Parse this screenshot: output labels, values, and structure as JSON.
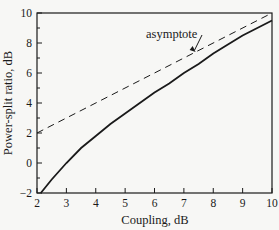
{
  "chart_data": {
    "type": "line",
    "title": "",
    "xlabel": "Coupling, dB",
    "ylabel": "Power-split ratio, dB",
    "xlim": [
      2,
      10
    ],
    "ylim": [
      -2,
      10
    ],
    "x_ticks": [
      2,
      3,
      4,
      5,
      6,
      7,
      8,
      9,
      10
    ],
    "y_ticks": [
      -2,
      0,
      2,
      4,
      6,
      8,
      10
    ],
    "y_minor_ticks": [
      -1,
      1,
      3,
      5,
      7,
      9
    ],
    "grid": false,
    "legend": null,
    "series": [
      {
        "name": "power-split ratio",
        "style": "solid",
        "x": [
          2.13,
          2.5,
          3.0,
          3.5,
          4.0,
          4.5,
          5.0,
          5.5,
          6.0,
          6.5,
          7.0,
          7.5,
          8.0,
          8.5,
          9.0,
          9.5,
          10.0
        ],
        "values": [
          -2.0,
          -1.1,
          0.0,
          1.0,
          1.8,
          2.6,
          3.3,
          4.0,
          4.7,
          5.3,
          6.0,
          6.6,
          7.3,
          7.9,
          8.5,
          9.0,
          9.5
        ]
      },
      {
        "name": "asymptote",
        "style": "dashed",
        "x": [
          2,
          10
        ],
        "values": [
          2,
          10
        ]
      }
    ],
    "annotations": [
      {
        "text": "asymptote",
        "arrow_to": [
          7.4,
          7.4
        ]
      }
    ]
  }
}
